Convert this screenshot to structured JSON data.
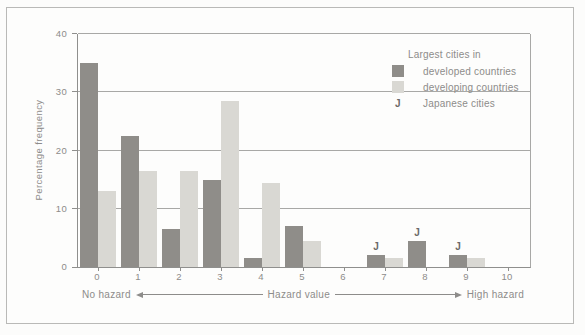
{
  "figure": {
    "legend": {
      "title": "Largest cities in",
      "items": [
        {
          "key": "developed",
          "marker": "swatch",
          "label": "developed countries"
        },
        {
          "key": "developing",
          "marker": "swatch",
          "label": "developing countries"
        },
        {
          "key": "japanese",
          "marker": "J",
          "label": "Japanese cities"
        }
      ]
    }
  },
  "chart_data": {
    "type": "bar",
    "title": "",
    "ylabel": "Percentage frequency",
    "xlabel": "Hazard value",
    "categories": [
      0,
      1,
      2,
      3,
      4,
      5,
      6,
      7,
      8,
      9,
      10
    ],
    "series": [
      {
        "name": "Largest cities in developed countries",
        "key": "developed",
        "color": "#8f8d89",
        "values": [
          35,
          22.5,
          6.5,
          15,
          1.5,
          7,
          0,
          2,
          4.5,
          2,
          0
        ]
      },
      {
        "name": "Largest cities in developing countries",
        "key": "developing",
        "color": "#d9d8d3",
        "values": [
          13,
          16.5,
          16.5,
          28.5,
          14.5,
          4.5,
          0,
          1.5,
          0,
          1.5,
          0
        ]
      }
    ],
    "j_label": "J",
    "j_marker_categories": [
      7,
      8,
      9
    ],
    "ylim": [
      0,
      40
    ],
    "yticks": [
      0,
      10,
      20,
      30,
      40
    ],
    "grid": true,
    "legend_position": "top-right",
    "annotations": {
      "left": "No hazard",
      "center": "Hazard value",
      "right": "High hazard"
    }
  },
  "colors": {
    "developed_bar": "#8f8d89",
    "developing_bar": "#d9d8d3",
    "grid_line": "#a8a8a6",
    "axis_line": "#8f8f8d",
    "text": "#8d8c8a",
    "j_marker": "#6b6967",
    "frame_border": "#b9b9b7"
  }
}
